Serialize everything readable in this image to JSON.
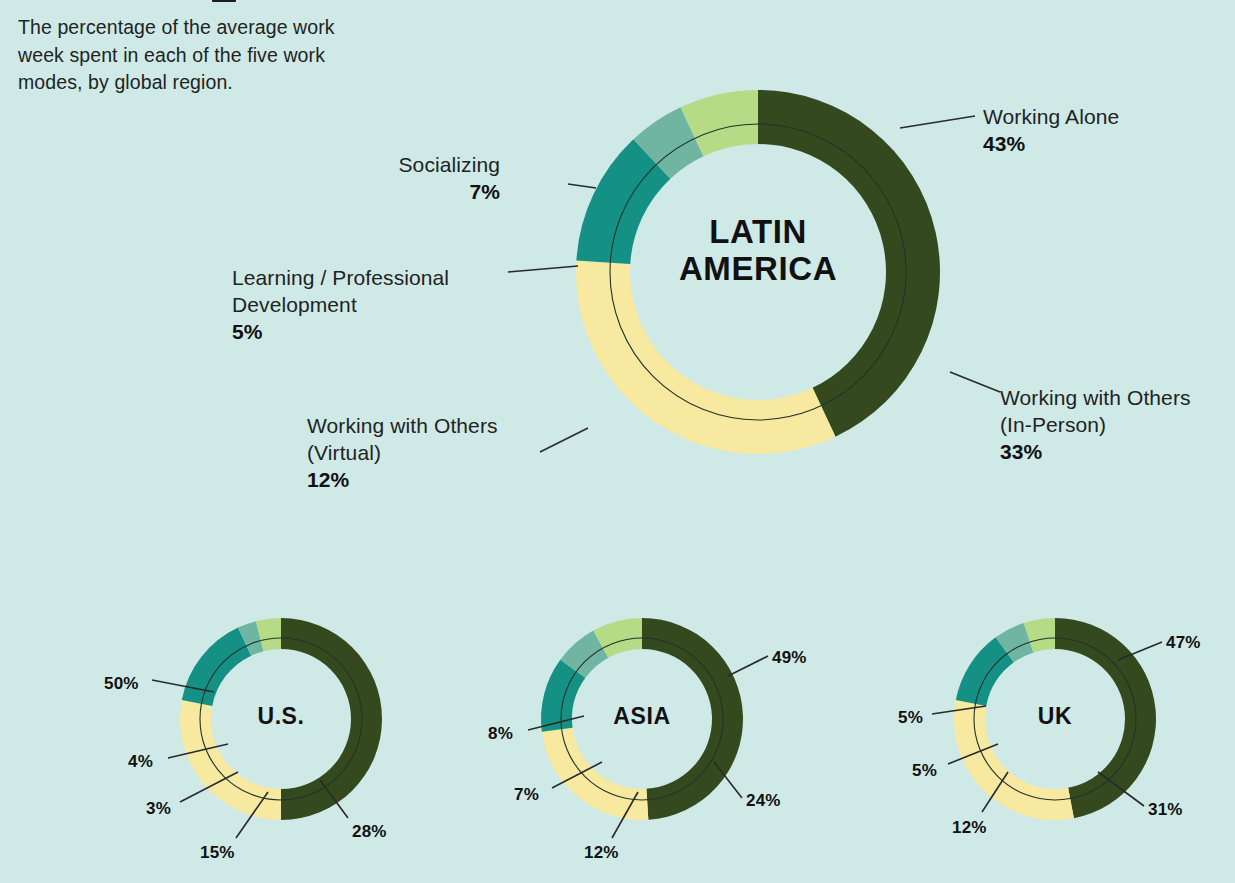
{
  "page": {
    "background_color": "#cfe9e7",
    "intro_text": "The percentage of the average work week spent in each of the five work modes, by global region."
  },
  "palette": {
    "working_alone": "#35491f",
    "socializing": "#b5db87",
    "learning": "#6fb5a2",
    "working_virtual": "#149184",
    "working_in_person": "#f7e9a0",
    "text": "#1e2423",
    "leader_line": "#2a2a2a"
  },
  "legend_modes": [
    "Working Alone",
    "Socializing",
    "Learning / Professional Development",
    "Working with Others (Virtual)",
    "Working with Others (In-Person)"
  ],
  "main_chart": {
    "region": "LATIN AMERICA",
    "region_line1": "LATIN",
    "region_line2": "AMERICA",
    "labels": {
      "working_alone": {
        "name": "Working Alone",
        "value": "43%"
      },
      "working_in_person": {
        "name_line1": "Working with Others",
        "name_line2": "(In-Person)",
        "value": "33%"
      },
      "working_virtual": {
        "name_line1": "Working with Others",
        "name_line2": "(Virtual)",
        "value": "12%"
      },
      "learning": {
        "name_line1": "Learning / Professional",
        "name_line2": "Development",
        "value": "5%"
      },
      "socializing": {
        "name": "Socializing",
        "value": "7%"
      }
    }
  },
  "small_charts": [
    {
      "region": "U.S.",
      "labels": {
        "working_alone": "50%",
        "socializing": "4%",
        "learning": "3%",
        "working_virtual": "15%",
        "working_in_person": "28%"
      }
    },
    {
      "region": "ASIA",
      "labels": {
        "working_alone": "49%",
        "socializing": "8%",
        "learning": "7%",
        "working_virtual": "12%",
        "working_in_person": "24%"
      }
    },
    {
      "region": "UK",
      "labels": {
        "working_alone": "47%",
        "socializing": "5%",
        "learning": "5%",
        "working_virtual": "12%",
        "working_in_person": "31%"
      }
    }
  ],
  "chart_data": {
    "type": "pie",
    "title": "The percentage of the average work week spent in each of the five work modes, by global region.",
    "subtitle": "",
    "xlabel": "",
    "ylabel": "",
    "grid": false,
    "legend_position": "callout-labels",
    "unit": "percent",
    "categories": [
      "Working Alone",
      "Working with Others (In-Person)",
      "Working with Others (Virtual)",
      "Learning / Professional Development",
      "Socializing"
    ],
    "category_colors": [
      "#35491f",
      "#f7e9a0",
      "#149184",
      "#6fb5a2",
      "#b5db87"
    ],
    "charts": [
      {
        "name": "LATIN AMERICA",
        "size": "large",
        "values": [
          43,
          33,
          12,
          5,
          7
        ],
        "labels": [
          "43%",
          "33%",
          "12%",
          "5%",
          "7%"
        ]
      },
      {
        "name": "U.S.",
        "size": "small",
        "values": [
          50,
          28,
          15,
          3,
          4
        ],
        "labels": [
          "50%",
          "28%",
          "15%",
          "3%",
          "4%"
        ]
      },
      {
        "name": "ASIA",
        "size": "small",
        "values": [
          49,
          24,
          12,
          7,
          8
        ],
        "labels": [
          "49%",
          "24%",
          "12%",
          "7%",
          "8%"
        ]
      },
      {
        "name": "UK",
        "size": "small",
        "values": [
          47,
          31,
          12,
          5,
          5
        ],
        "labels": [
          "47%",
          "31%",
          "12%",
          "5%",
          "5%"
        ]
      }
    ]
  }
}
